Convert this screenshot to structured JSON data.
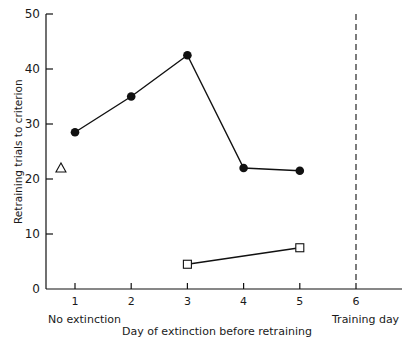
{
  "chart_data": {
    "type": "line",
    "title": "",
    "xlabel": "Day of extinction before retraining",
    "ylabel": "Retraining trials to criterion",
    "xlim": [
      0.5,
      7
    ],
    "ylim": [
      0,
      50
    ],
    "x_ticks": [
      "1",
      "2",
      "3",
      "4",
      "5",
      "6"
    ],
    "y_ticks": [
      "0",
      "10",
      "20",
      "30",
      "40",
      "50"
    ],
    "annotations": [
      {
        "text": "No extinction",
        "x": 1
      },
      {
        "text": "Training day",
        "x": 6
      }
    ],
    "reference_lines": [
      {
        "type": "vertical",
        "x": 6,
        "style": "dashed"
      }
    ],
    "grid": false,
    "legend": "none",
    "series": [
      {
        "name": "filled-circles",
        "marker": "filled-circle",
        "x": [
          1,
          2,
          3,
          4,
          5
        ],
        "values": [
          28.5,
          35,
          42.5,
          22,
          21.5
        ]
      },
      {
        "name": "open-squares",
        "marker": "open-square",
        "x": [
          3,
          5
        ],
        "values": [
          4.5,
          7.5
        ]
      },
      {
        "name": "open-triangle",
        "marker": "open-triangle",
        "x": [
          0.75
        ],
        "values": [
          22
        ]
      }
    ]
  },
  "labels": {
    "xlabel": "Day of extinction before retraining",
    "ylabel": "Retraining trials to criterion",
    "no_extinction": "No extinction",
    "training_day": "Training day",
    "yticks": [
      "0",
      "10",
      "20",
      "30",
      "40",
      "50"
    ],
    "xticks": [
      "1",
      "2",
      "3",
      "4",
      "5",
      "6"
    ]
  }
}
